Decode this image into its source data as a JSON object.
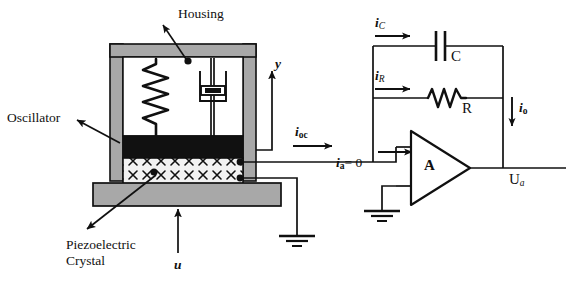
{
  "figure": {
    "kind": "schematic-diagram",
    "background_color": "#ffffff",
    "line_color": "#101010",
    "housing_fill": "#a8a8a8",
    "oscillator_fill": "#111111",
    "crystal_fill": "#f2f2f2",
    "base_fill": "#a8a8a8"
  },
  "labels": {
    "housing": "Housing",
    "oscillator": "Oscillator",
    "piezo_line1": "Piezoelectric",
    "piezo_line2": "Crystal",
    "axis_y": "y",
    "input_u": "u",
    "current_ioc_main": "i",
    "current_ioc_sub": "oc",
    "current_ic_main": "i",
    "current_ic_sub": "C",
    "current_ir_main": "i",
    "current_ir_sub": "R",
    "current_ia_main": "i",
    "current_ia_sub": "a",
    "current_ia_eq": "= 0",
    "current_io_main": "i",
    "current_io_sub": "o",
    "capacitor": "C",
    "resistor": "R",
    "amplifier": "A",
    "output_main": "U",
    "output_sub": "a"
  },
  "components": [
    {
      "name": "housing",
      "type": "mechanical-frame"
    },
    {
      "name": "spring",
      "type": "mechanical-spring"
    },
    {
      "name": "damper",
      "type": "mechanical-damper"
    },
    {
      "name": "oscillator-mass",
      "type": "seismic-mass"
    },
    {
      "name": "piezoelectric-crystal",
      "type": "crystal-hatched"
    },
    {
      "name": "base-plate",
      "type": "mounting-base"
    },
    {
      "name": "capacitor",
      "type": "capacitor",
      "label": "C"
    },
    {
      "name": "resistor",
      "type": "resistor",
      "label": "R"
    },
    {
      "name": "operational-amplifier",
      "type": "op-amp",
      "label": "A"
    },
    {
      "name": "ground-sensor",
      "type": "ground"
    },
    {
      "name": "ground-amplifier",
      "type": "ground"
    }
  ]
}
